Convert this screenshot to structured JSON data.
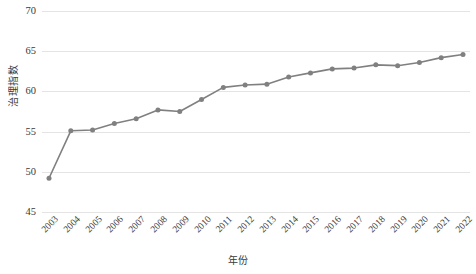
{
  "chart_data": {
    "type": "line",
    "title": "",
    "xlabel": "年份",
    "ylabel": "治理指数",
    "x": [
      2003,
      2004,
      2005,
      2006,
      2007,
      2008,
      2009,
      2010,
      2011,
      2012,
      2013,
      2014,
      2015,
      2016,
      2017,
      2018,
      2019,
      2020,
      2021,
      2022
    ],
    "categories": [
      "2003",
      "2004",
      "2005",
      "2006",
      "2007",
      "2008",
      "2009",
      "2010",
      "2011",
      "2012",
      "2013",
      "2014",
      "2015",
      "2016",
      "2017",
      "2018",
      "2019",
      "2020",
      "2021",
      "2022"
    ],
    "values": [
      49.2,
      55.1,
      55.2,
      56.0,
      56.6,
      57.7,
      57.5,
      59.0,
      60.5,
      60.8,
      60.9,
      61.8,
      62.3,
      62.8,
      62.9,
      63.3,
      63.2,
      63.6,
      64.2,
      64.6
    ],
    "series": [
      {
        "name": "治理指数",
        "values": [
          49.2,
          55.1,
          55.2,
          56.0,
          56.6,
          57.7,
          57.5,
          59.0,
          60.5,
          60.8,
          60.9,
          61.8,
          62.3,
          62.8,
          62.9,
          63.3,
          63.2,
          63.6,
          64.2,
          64.6
        ]
      }
    ],
    "ylim": [
      45,
      70
    ],
    "yticks": [
      45,
      50,
      55,
      60,
      65,
      70
    ],
    "ytick_labels": [
      "45",
      "50",
      "55",
      "60",
      "65",
      "70"
    ],
    "grid": true,
    "grid_axis": "y",
    "legend": false,
    "legend_position": "none",
    "marker": "circle",
    "line_color": "#808080",
    "marker_color": "#808080",
    "grid_color": "#e4e4e4",
    "background_color": "#ffffff",
    "x_tick_rotation": -45
  }
}
